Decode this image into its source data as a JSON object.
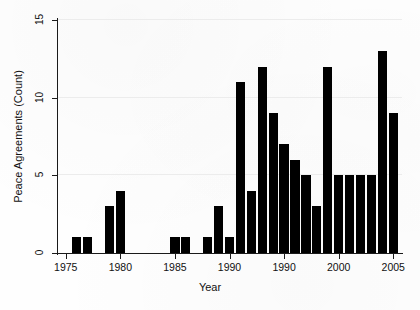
{
  "chart_data": {
    "type": "bar",
    "title": "",
    "xlabel": "Year",
    "ylabel": "Peace Agreements (Count)",
    "xlim": [
      1974.2,
      2005.8
    ],
    "ylim": [
      0,
      15
    ],
    "yticks": [
      0,
      5,
      10,
      15
    ],
    "ytick_labels": [
      "0",
      "5",
      "10",
      "15"
    ],
    "xticks": [
      1975,
      1980,
      1985,
      1990,
      1995,
      2000,
      2005
    ],
    "xtick_labels": [
      "1975",
      "1980",
      "1985",
      "1990",
      "1990",
      "2000",
      "2005"
    ],
    "grid": "horizontal",
    "legend": "none",
    "bar_color": "#000000",
    "categories": [
      1976,
      1977,
      1979,
      1980,
      1985,
      1986,
      1988,
      1989,
      1990,
      1991,
      1992,
      1993,
      1994,
      1995,
      1996,
      1997,
      1998,
      1999,
      2000,
      2001,
      2002,
      2003,
      2004,
      2005
    ],
    "values": [
      1,
      1,
      3,
      4,
      1,
      1,
      1,
      3,
      1,
      11,
      4,
      12,
      9,
      7,
      6,
      5,
      3,
      12,
      5,
      5,
      5,
      5,
      13,
      9
    ],
    "points": [
      {
        "year": 1976,
        "count": 1
      },
      {
        "year": 1977,
        "count": 1
      },
      {
        "year": 1979,
        "count": 3
      },
      {
        "year": 1980,
        "count": 4
      },
      {
        "year": 1985,
        "count": 1
      },
      {
        "year": 1986,
        "count": 1
      },
      {
        "year": 1988,
        "count": 1
      },
      {
        "year": 1989,
        "count": 3
      },
      {
        "year": 1990,
        "count": 1
      },
      {
        "year": 1991,
        "count": 11
      },
      {
        "year": 1992,
        "count": 4
      },
      {
        "year": 1993,
        "count": 12
      },
      {
        "year": 1994,
        "count": 9
      },
      {
        "year": 1995,
        "count": 7
      },
      {
        "year": 1996,
        "count": 6
      },
      {
        "year": 1997,
        "count": 5
      },
      {
        "year": 1998,
        "count": 3
      },
      {
        "year": 1999,
        "count": 12
      },
      {
        "year": 2000,
        "count": 5
      },
      {
        "year": 2001,
        "count": 5
      },
      {
        "year": 2002,
        "count": 5
      },
      {
        "year": 2003,
        "count": 5
      },
      {
        "year": 2004,
        "count": 13
      },
      {
        "year": 2005,
        "count": 9
      }
    ]
  }
}
